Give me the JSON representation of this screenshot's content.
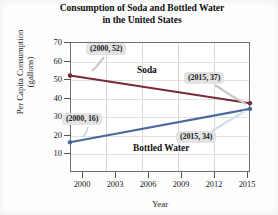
{
  "chart_data": {
    "type": "line",
    "title": "Consumption of Soda and Bottled Water in the United States",
    "title_line1": "Consumption of Soda and Bottled Water",
    "title_line2": "in the United States",
    "xlabel": "Year",
    "ylabel": "Per Capita Consumption (gallons)",
    "ylabel_line1": "Per Capita Consumption",
    "ylabel_line2": "(gallons)",
    "xlim": [
      2000,
      2015
    ],
    "ylim": [
      0,
      70
    ],
    "xticks": [
      "2000",
      "2003",
      "2006",
      "2009",
      "2012",
      "2015"
    ],
    "xtick_values": [
      2000,
      2003,
      2006,
      2009,
      2012,
      2015
    ],
    "yticks": [
      "10",
      "20",
      "30",
      "40",
      "50",
      "60",
      "70"
    ],
    "ytick_values": [
      10,
      20,
      30,
      40,
      50,
      60,
      70
    ],
    "grid": true,
    "legend": "inline-labels",
    "x": [
      2000,
      2015
    ],
    "series": [
      {
        "name": "Soda",
        "color": "#7a2a3a",
        "values": [
          52,
          37
        ],
        "points": [
          {
            "x": 2000,
            "y": 52
          },
          {
            "x": 2015,
            "y": 37
          }
        ]
      },
      {
        "name": "Bottled Water",
        "color": "#4a6a9a",
        "values": [
          16,
          34
        ],
        "points": [
          {
            "x": 2000,
            "y": 16
          },
          {
            "x": 2015,
            "y": 34
          }
        ]
      }
    ],
    "annotations": [
      {
        "label": "(2000, 52)",
        "series": "Soda",
        "x": 2000,
        "y": 52
      },
      {
        "label": "(2015, 37)",
        "series": "Soda",
        "x": 2015,
        "y": 37
      },
      {
        "label": "(2000, 16)",
        "series": "Bottled Water",
        "x": 2000,
        "y": 16
      },
      {
        "label": "(2015, 34)",
        "series": "Bottled Water",
        "x": 2015,
        "y": 34
      }
    ],
    "series_labels": [
      {
        "text": "Soda"
      },
      {
        "text": "Bottled Water"
      }
    ]
  }
}
